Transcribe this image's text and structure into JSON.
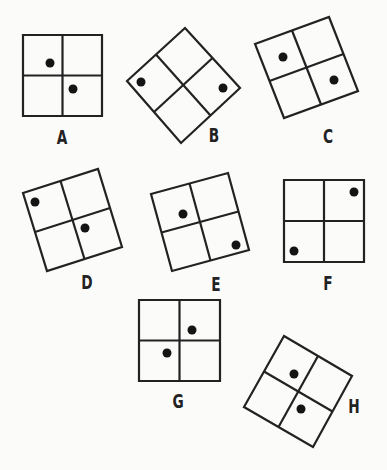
{
  "figures": [
    {
      "label": "A",
      "corners": [
        [
          23,
          35
        ],
        [
          102,
          35
        ],
        [
          102,
          116
        ],
        [
          23,
          116
        ]
      ],
      "dots": [
        [
          50,
          63
        ],
        [
          73,
          89
        ]
      ],
      "label_pos": [
        62,
        137
      ]
    },
    {
      "label": "B",
      "corners": [
        [
          185,
          28
        ],
        [
          240,
          88
        ],
        [
          181,
          143
        ],
        [
          127,
          81
        ]
      ],
      "dots": [
        [
          141,
          82
        ],
        [
          223,
          88
        ]
      ],
      "label_pos": [
        214,
        135
      ]
    },
    {
      "label": "C",
      "corners": [
        [
          255,
          44
        ],
        [
          329,
          17
        ],
        [
          358,
          91
        ],
        [
          284,
          118
        ]
      ],
      "dots": [
        [
          283,
          57
        ],
        [
          334,
          80
        ]
      ],
      "label_pos": [
        328,
        136
      ]
    },
    {
      "label": "D",
      "corners": [
        [
          23,
          193
        ],
        [
          98,
          169
        ],
        [
          122,
          247
        ],
        [
          47,
          271
        ]
      ],
      "dots": [
        [
          35,
          202
        ],
        [
          85,
          228
        ]
      ],
      "label_pos": [
        87,
        282
      ]
    },
    {
      "label": "E",
      "corners": [
        [
          151,
          194
        ],
        [
          228,
          173
        ],
        [
          249,
          250
        ],
        [
          172,
          271
        ]
      ],
      "dots": [
        [
          183,
          214
        ],
        [
          236,
          245
        ]
      ],
      "label_pos": [
        216,
        284
      ]
    },
    {
      "label": "F",
      "corners": [
        [
          284,
          180
        ],
        [
          364,
          180
        ],
        [
          364,
          262
        ],
        [
          284,
          262
        ]
      ],
      "dots": [
        [
          354,
          192
        ],
        [
          294,
          251
        ]
      ],
      "label_pos": [
        328,
        283
      ]
    },
    {
      "label": "G",
      "corners": [
        [
          139,
          300
        ],
        [
          220,
          300
        ],
        [
          220,
          381
        ],
        [
          139,
          381
        ]
      ],
      "dots": [
        [
          192,
          330
        ],
        [
          167,
          353
        ]
      ],
      "label_pos": [
        178,
        401
      ]
    },
    {
      "label": "H",
      "corners": [
        [
          284,
          336
        ],
        [
          352,
          376
        ],
        [
          313,
          447
        ],
        [
          244,
          407
        ]
      ],
      "dots": [
        [
          294,
          374
        ],
        [
          301,
          409
        ]
      ],
      "label_pos": [
        354,
        406
      ]
    }
  ],
  "style": {
    "stroke_color": "#222222",
    "dot_color": "#141414",
    "background": "#fbfbfa",
    "dot_radius": 4.5
  }
}
